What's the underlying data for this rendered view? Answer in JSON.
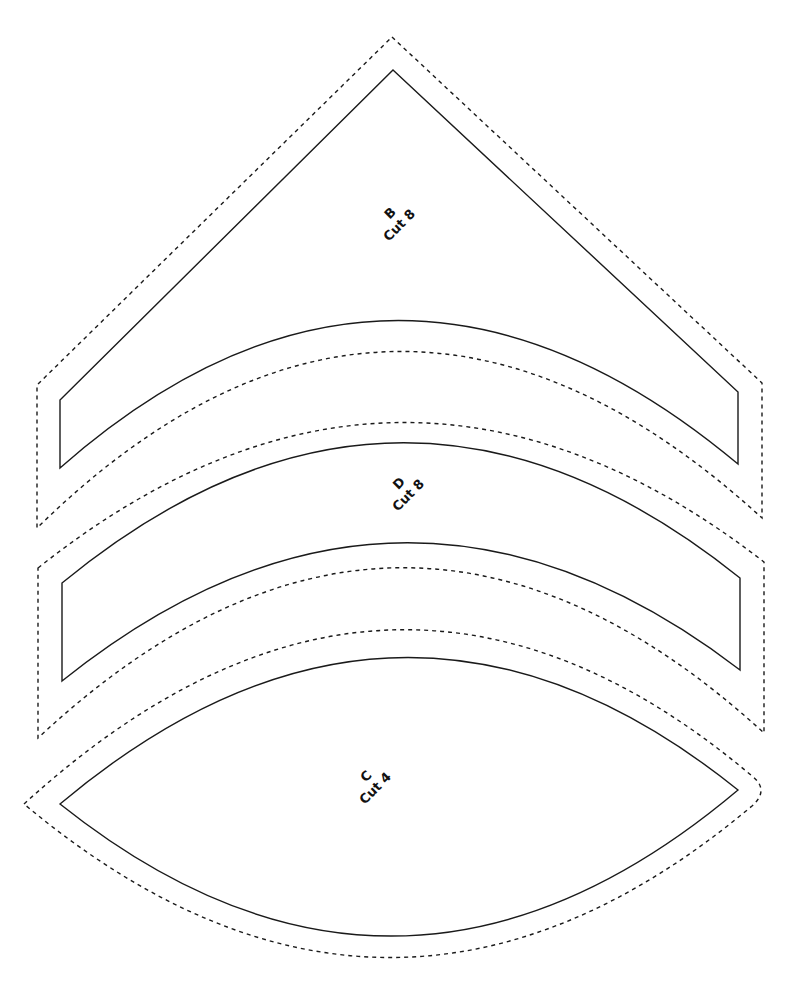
{
  "pieces": [
    {
      "id": "B",
      "shape": "triangle-with-concave-base",
      "label_letter": "B",
      "label_cut": "Cut 8",
      "cut_line": "M393,70 L738,392 L738,464 Q393,175 60,468 L60,400 Z",
      "seam_line": "M392,37 L762,383 L762,518 Q392,180 37,528 L37,385 Z",
      "label_pos": {
        "x": 396,
        "y": 222,
        "rotate": -45
      }
    },
    {
      "id": "D",
      "shape": "curved-band",
      "label_letter": "D",
      "label_cut": "Cut 8",
      "cut_line": "M62,583 Q400,305 740,578 L740,670 Q400,410 62,681 Z",
      "seam_line": "M38,568 Q400,280 764,562 L764,733 Q400,400 38,738 Z",
      "label_pos": {
        "x": 405,
        "y": 492,
        "rotate": -45
      }
    },
    {
      "id": "C",
      "shape": "lens",
      "label_letter": "C",
      "label_cut": "Cut 4",
      "cut_line": "M60,804 Q400,518 738,790 Q400,1075 60,804 Z",
      "seam_line": "M24,804 Q390,470 752,776 Q770,790 752,806 Q390,1110 24,804 Z",
      "label_pos": {
        "x": 372,
        "y": 785,
        "rotate": -45
      }
    }
  ],
  "style": {
    "cut_line": "solid",
    "seam_allowance_line": "dashed",
    "line_color": "#1a1a1a",
    "background": "#ffffff"
  }
}
